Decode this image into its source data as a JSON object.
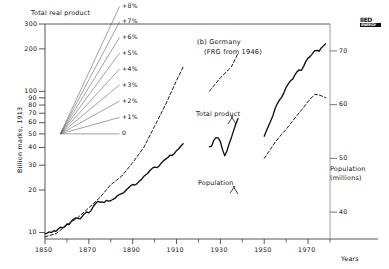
{
  "chart_data": {
    "type": "line",
    "title": "(b) Germany",
    "subtitle": "(FRG from 1946)",
    "top_label": "Total real product",
    "ylabel": "Billion marks, 1913",
    "xlabel": "Years",
    "right_axis_label_line1": "Population",
    "right_axis_label_line2": "(millions)",
    "scale": "logarithmic",
    "grid": false,
    "xlim": [
      1850,
      1980
    ],
    "ylim": [
      9,
      300
    ],
    "ylim_right": [
      35,
      75
    ],
    "xticks": [
      1850,
      1870,
      1890,
      1910,
      1930,
      1950,
      1970
    ],
    "xtick_labels": [
      "1850",
      "1870",
      "1890",
      "1910",
      "1930",
      "1950",
      "1970"
    ],
    "xticks_minor": [
      1860,
      1880,
      1900,
      1920,
      1940,
      1960,
      1980
    ],
    "yticks": [
      10,
      20,
      30,
      40,
      50,
      60,
      70,
      80,
      90,
      100,
      200,
      300
    ],
    "ytick_labels": [
      "10",
      "20",
      "30",
      "40",
      "50",
      "60",
      "70",
      "80",
      "90",
      "100",
      "200",
      "300"
    ],
    "yticks_right": [
      40,
      50,
      60,
      70
    ],
    "ytick_labels_right": [
      "40",
      "50",
      "60",
      "70"
    ],
    "annotations": [
      {
        "text": "Total product",
        "x": 1922,
        "y": 95
      },
      {
        "text": "Population",
        "x": 1905,
        "y": 17.5
      }
    ],
    "growth_fan": {
      "origin_x": 1857,
      "origin_y": 50,
      "end_x": 1884,
      "labels": [
        "+8%",
        "+7%",
        "+6%",
        "+5%",
        "+4%",
        "+3%",
        "+2%",
        "+1%",
        "0"
      ],
      "rates": [
        8,
        7,
        6,
        5,
        4,
        3,
        2,
        1,
        0
      ]
    },
    "series": [
      {
        "name": "Total product",
        "style": "solid",
        "color": "#111111",
        "segments": [
          {
            "label": "1850-1913",
            "points": [
              [
                1850,
                9.8
              ],
              [
                1851,
                9.9
              ],
              [
                1852,
                10.1
              ],
              [
                1853,
                10.0
              ],
              [
                1854,
                10.3
              ],
              [
                1855,
                10.2
              ],
              [
                1856,
                10.6
              ],
              [
                1857,
                10.9
              ],
              [
                1858,
                10.8
              ],
              [
                1859,
                11.0
              ],
              [
                1860,
                11.5
              ],
              [
                1861,
                11.4
              ],
              [
                1862,
                12.0
              ],
              [
                1863,
                12.4
              ],
              [
                1864,
                12.7
              ],
              [
                1865,
                12.6
              ],
              [
                1866,
                12.5
              ],
              [
                1867,
                13.0
              ],
              [
                1868,
                13.6
              ],
              [
                1869,
                14.0
              ],
              [
                1870,
                13.8
              ],
              [
                1871,
                14.3
              ],
              [
                1872,
                15.3
              ],
              [
                1873,
                16.0
              ],
              [
                1874,
                16.6
              ],
              [
                1875,
                16.4
              ],
              [
                1876,
                16.5
              ],
              [
                1877,
                16.3
              ],
              [
                1878,
                16.9
              ],
              [
                1879,
                16.7
              ],
              [
                1880,
                16.8
              ],
              [
                1881,
                17.2
              ],
              [
                1882,
                17.5
              ],
              [
                1883,
                18.2
              ],
              [
                1884,
                18.6
              ],
              [
                1885,
                18.9
              ],
              [
                1886,
                19.2
              ],
              [
                1887,
                20.0
              ],
              [
                1888,
                20.7
              ],
              [
                1889,
                21.4
              ],
              [
                1890,
                21.9
              ],
              [
                1891,
                21.7
              ],
              [
                1892,
                22.2
              ],
              [
                1893,
                23.1
              ],
              [
                1894,
                23.8
              ],
              [
                1895,
                24.9
              ],
              [
                1896,
                25.7
              ],
              [
                1897,
                26.4
              ],
              [
                1898,
                27.6
              ],
              [
                1899,
                28.6
              ],
              [
                1900,
                29.1
              ],
              [
                1901,
                28.8
              ],
              [
                1902,
                29.5
              ],
              [
                1903,
                31.0
              ],
              [
                1904,
                32.2
              ],
              [
                1905,
                33.1
              ],
              [
                1906,
                34.0
              ],
              [
                1907,
                35.3
              ],
              [
                1908,
                35.2
              ],
              [
                1909,
                36.3
              ],
              [
                1910,
                38.0
              ],
              [
                1911,
                39.2
              ],
              [
                1912,
                41.0
              ],
              [
                1913,
                42.5
              ]
            ]
          },
          {
            "label": "1925-1938",
            "points": [
              [
                1925,
                40.5
              ],
              [
                1926,
                41.0
              ],
              [
                1927,
                45.0
              ],
              [
                1928,
                47.0
              ],
              [
                1929,
                46.8
              ],
              [
                1930,
                44.0
              ],
              [
                1931,
                38.5
              ],
              [
                1932,
                35.0
              ],
              [
                1933,
                38.0
              ],
              [
                1934,
                42.5
              ],
              [
                1935,
                47.0
              ],
              [
                1936,
                52.5
              ],
              [
                1937,
                58.5
              ],
              [
                1938,
                64.0
              ]
            ]
          },
          {
            "label": "1950-1978",
            "points": [
              [
                1950,
                48.0
              ],
              [
                1951,
                52.5
              ],
              [
                1952,
                57.0
              ],
              [
                1953,
                62.0
              ],
              [
                1954,
                67.5
              ],
              [
                1955,
                76.0
              ],
              [
                1956,
                82.0
              ],
              [
                1957,
                87.0
              ],
              [
                1958,
                91.0
              ],
              [
                1959,
                98.0
              ],
              [
                1960,
                107.0
              ],
              [
                1961,
                113.0
              ],
              [
                1962,
                119.0
              ],
              [
                1963,
                122.0
              ],
              [
                1964,
                131.0
              ],
              [
                1965,
                138.0
              ],
              [
                1966,
                142.0
              ],
              [
                1967,
                141.0
              ],
              [
                1968,
                151.0
              ],
              [
                1969,
                163.0
              ],
              [
                1970,
                172.0
              ],
              [
                1971,
                177.0
              ],
              [
                1972,
                185.0
              ],
              [
                1973,
                194.0
              ],
              [
                1974,
                195.0
              ],
              [
                1975,
                192.0
              ],
              [
                1976,
                203.0
              ],
              [
                1977,
                210.0
              ],
              [
                1978,
                217.0
              ]
            ]
          }
        ]
      },
      {
        "name": "Population",
        "style": "dashed",
        "color": "#111111",
        "axis": "right",
        "segments": [
          {
            "label": "1850-1913",
            "points": [
              [
                1850,
                35.4
              ],
              [
                1855,
                36.0
              ],
              [
                1860,
                37.6
              ],
              [
                1865,
                39.0
              ],
              [
                1870,
                40.8
              ],
              [
                1875,
                42.7
              ],
              [
                1880,
                45.1
              ],
              [
                1885,
                46.7
              ],
              [
                1890,
                49.2
              ],
              [
                1895,
                52.0
              ],
              [
                1900,
                56.0
              ],
              [
                1905,
                60.0
              ],
              [
                1910,
                64.5
              ],
              [
                1913,
                67.0
              ]
            ]
          },
          {
            "label": "1925-1938",
            "points": [
              [
                1925,
                62.5
              ],
              [
                1930,
                65.0
              ],
              [
                1935,
                67.0
              ],
              [
                1938,
                69.5
              ]
            ]
          },
          {
            "label": "1950-1978",
            "points": [
              [
                1950,
                50.0
              ],
              [
                1952,
                51.2
              ],
              [
                1955,
                53.0
              ],
              [
                1958,
                54.5
              ],
              [
                1960,
                55.4
              ],
              [
                1963,
                57.0
              ],
              [
                1965,
                58.0
              ],
              [
                1968,
                59.5
              ],
              [
                1970,
                60.6
              ],
              [
                1973,
                61.9
              ],
              [
                1975,
                61.8
              ],
              [
                1978,
                61.3
              ]
            ]
          }
        ]
      }
    ],
    "logo": {
      "top": "IIED",
      "bottom": "ENERGY"
    }
  }
}
